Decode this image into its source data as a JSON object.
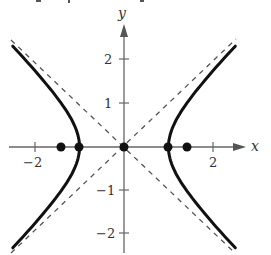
{
  "figure": {
    "axes": {
      "x_label": "x",
      "y_label": "y",
      "x_ticks": [
        {
          "value": -2,
          "label": "−2"
        },
        {
          "value": 2,
          "label": "2"
        }
      ],
      "y_ticks": [
        {
          "value": 2,
          "label": "2"
        },
        {
          "value": 1,
          "label": "1"
        },
        {
          "value": -1,
          "label": "−1"
        },
        {
          "value": -2,
          "label": "−2"
        }
      ],
      "x_range": [
        -2.6,
        2.6
      ],
      "y_range": [
        -2.4,
        2.7
      ]
    },
    "curve": {
      "equation": "x^2 - y^2 = 1",
      "branches": [
        "left",
        "right"
      ],
      "color": "#111111"
    },
    "asymptotes": [
      {
        "equation": "y = x",
        "style": "dashed"
      },
      {
        "equation": "y = -x",
        "style": "dashed"
      }
    ],
    "points": [
      {
        "name": "left-focus",
        "x": -1.414,
        "y": 0
      },
      {
        "name": "left-vertex",
        "x": -1,
        "y": 0
      },
      {
        "name": "center",
        "x": 0,
        "y": 0
      },
      {
        "name": "right-vertex",
        "x": 1,
        "y": 0
      },
      {
        "name": "right-focus",
        "x": 1.414,
        "y": 0
      }
    ]
  }
}
